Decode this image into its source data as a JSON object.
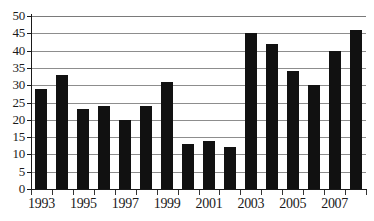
{
  "chart_data": {
    "type": "bar",
    "title": "",
    "subtitle": "",
    "xlabel": "",
    "ylabel": "",
    "ylim": [
      0,
      50
    ],
    "ytick_step": 5,
    "yticks": [
      0,
      5,
      10,
      15,
      20,
      25,
      30,
      35,
      40,
      45,
      50
    ],
    "ytick_labels": [
      "0",
      "5",
      "10",
      "15",
      "20",
      "25",
      "30",
      "35",
      "40",
      "45",
      "50"
    ],
    "grid": true,
    "grid_axis": "y",
    "legend": false,
    "legend_position": "none",
    "bar_color": "#111111",
    "grid_color": "#8d8d8d",
    "axis_color": "#1a1a1a",
    "background_color": "#ffffff",
    "categories": [
      "1993",
      "1994",
      "1995",
      "1996",
      "1997",
      "1998",
      "1999",
      "2000",
      "2001",
      "2002",
      "2003",
      "2004",
      "2005",
      "2006",
      "2007",
      "2008"
    ],
    "values": [
      29,
      33,
      23,
      24,
      20,
      24,
      31,
      13,
      14,
      12,
      45,
      42,
      34,
      30,
      40,
      46
    ],
    "xtick_labels": [
      "1993",
      "1995",
      "1997",
      "1999",
      "2001",
      "2003",
      "2005",
      "2007"
    ],
    "xtick_categories": [
      "1993",
      "1995",
      "1997",
      "1999",
      "2001",
      "2003",
      "2005",
      "2007"
    ]
  }
}
